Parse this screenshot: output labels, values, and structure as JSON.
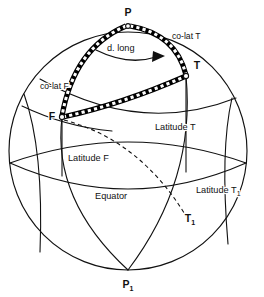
{
  "figure": {
    "type": "geometry-diagram",
    "background_color": "#ffffff",
    "line_color": "#111111"
  },
  "points": {
    "pole_north": {
      "label": "P",
      "x": 128,
      "y": 16
    },
    "from": {
      "label": "F",
      "x": 52,
      "y": 116
    },
    "to": {
      "label": "T",
      "x": 196,
      "y": 69
    },
    "to_foot": {
      "label": "T",
      "sub": "1",
      "x": 191,
      "y": 219
    },
    "pole_south": {
      "label": "P",
      "sub": "1",
      "x": 128,
      "y": 286
    }
  },
  "labels": {
    "co_lat_from": "co-lat F",
    "co_lat_to": "co-lat T",
    "d_long": "d. long",
    "latitude_from": "Latitude F",
    "latitude_to": "Latitude T",
    "latitude_to_foot": "Latitude T",
    "latitude_to_foot_sub": "1",
    "equator": "Equator"
  },
  "label_positions": {
    "co_lat_from": {
      "x": 40,
      "y": 88
    },
    "co_lat_to": {
      "x": 174,
      "y": 38
    },
    "d_long": {
      "x": 106,
      "y": 48
    },
    "latitude_from": {
      "x": 68,
      "y": 158
    },
    "latitude_to": {
      "x": 155,
      "y": 127
    },
    "latitude_to_foot": {
      "x": 197,
      "y": 190
    },
    "equator": {
      "x": 95,
      "y": 196
    }
  }
}
